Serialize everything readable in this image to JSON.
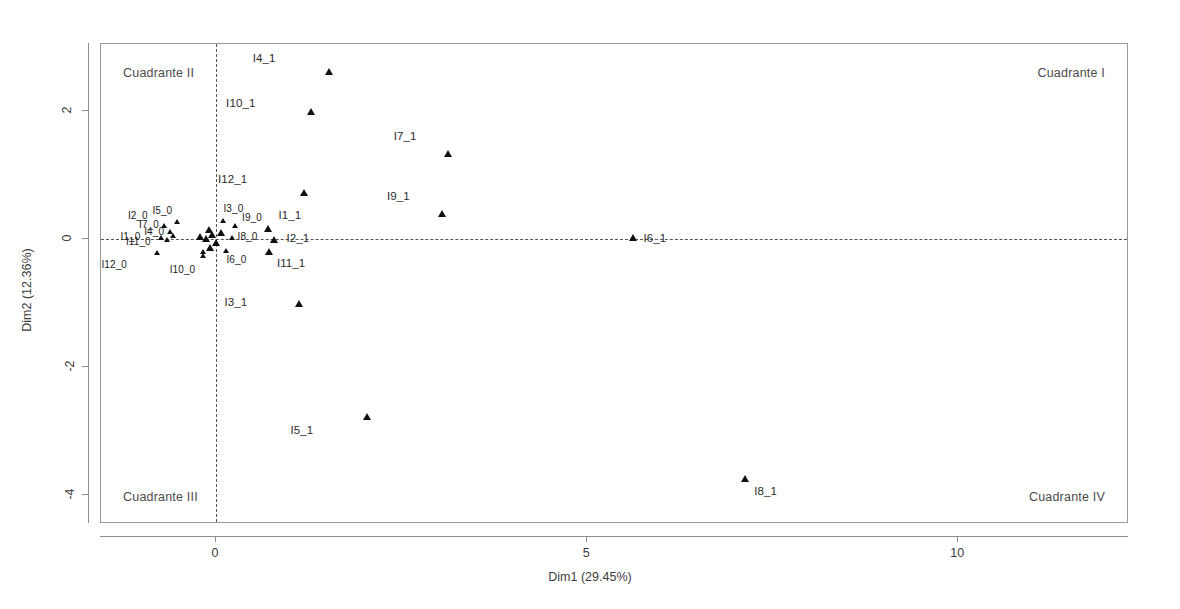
{
  "chart_data": {
    "type": "scatter",
    "title": "",
    "xlabel": "Dim1 (29.45%)",
    "ylabel": "Dim2 (12.36%)",
    "xlim": [
      -1.55,
      12.3
    ],
    "ylim": [
      -4.45,
      3.05
    ],
    "xticks": [
      0,
      5,
      10
    ],
    "xticklabels": [
      "0",
      "5",
      "10"
    ],
    "yticks": [
      2,
      0,
      -2,
      -4
    ],
    "yticklabels": [
      "2",
      "0",
      "-2",
      "-4"
    ],
    "grid": false,
    "legend": null,
    "reference_lines": {
      "vertical_x": 0,
      "horizontal_y": 0,
      "style": "dashed"
    },
    "marker": "triangle",
    "marker_color": "#111111",
    "annotations": [
      {
        "text": "Cuadrante II",
        "position": "top-left"
      },
      {
        "text": "Cuadrante I",
        "position": "top-right"
      },
      {
        "text": "Cuadrante III",
        "position": "bottom-left"
      },
      {
        "text": "Cuadrante IV",
        "position": "bottom-right"
      }
    ],
    "points": [
      {
        "label": "I4_1",
        "x": 1.52,
        "y": 2.62,
        "lx": -0.72,
        "ly": 0.2,
        "size": "normal"
      },
      {
        "label": "I10_1",
        "x": 1.28,
        "y": 1.98,
        "lx": -0.75,
        "ly": 0.14,
        "size": "normal"
      },
      {
        "label": "I7_1",
        "x": 3.12,
        "y": 1.33,
        "lx": -0.42,
        "ly": 0.26,
        "size": "normal"
      },
      {
        "label": "I12_1",
        "x": 1.18,
        "y": 0.72,
        "lx": -0.76,
        "ly": 0.2,
        "size": "normal"
      },
      {
        "label": "I9_1",
        "x": 3.05,
        "y": 0.4,
        "lx": -0.44,
        "ly": 0.26,
        "size": "normal"
      },
      {
        "label": "I1_1",
        "x": 0.7,
        "y": 0.16,
        "lx": 0.14,
        "ly": 0.2,
        "size": "normal"
      },
      {
        "label": "I2_1",
        "x": 0.78,
        "y": -0.02,
        "lx": 0.17,
        "ly": 0.02,
        "size": "normal"
      },
      {
        "label": "I11_1",
        "x": 0.72,
        "y": -0.2,
        "lx": 0.1,
        "ly": -0.18,
        "size": "normal"
      },
      {
        "label": "I6_1",
        "x": 5.62,
        "y": 0.02,
        "lx": 0.14,
        "ly": -0.02,
        "size": "normal"
      },
      {
        "label": "I3_1",
        "x": 1.12,
        "y": -1.02,
        "lx": -0.7,
        "ly": 0.02,
        "size": "normal"
      },
      {
        "label": "I5_1",
        "x": 2.03,
        "y": -2.78,
        "lx": -0.72,
        "ly": -0.22,
        "size": "normal"
      },
      {
        "label": "I8_1",
        "x": 7.12,
        "y": -3.75,
        "lx": 0.13,
        "ly": -0.2,
        "size": "normal"
      },
      {
        "label": "I5_0",
        "x": -0.52,
        "y": 0.27,
        "lx": -0.07,
        "ly": 0.16,
        "size": "small"
      },
      {
        "label": "I2_0",
        "x": -0.7,
        "y": 0.2,
        "lx": -0.22,
        "ly": 0.14,
        "size": "small"
      },
      {
        "label": "I7_0",
        "x": -0.62,
        "y": 0.12,
        "lx": -0.15,
        "ly": 0.09,
        "size": "small"
      },
      {
        "label": "I4_0",
        "x": -0.58,
        "y": 0.05,
        "lx": -0.12,
        "ly": 0.04,
        "size": "small"
      },
      {
        "label": "I1_0",
        "x": -0.74,
        "y": 0.02,
        "lx": -0.28,
        "ly": 0.0,
        "size": "small"
      },
      {
        "label": "I11_0",
        "x": -0.66,
        "y": -0.02,
        "lx": -0.22,
        "ly": -0.04,
        "size": "small"
      },
      {
        "label": "I12_0",
        "x": -0.8,
        "y": -0.22,
        "lx": -0.4,
        "ly": -0.2,
        "size": "small"
      },
      {
        "label": "I10_0",
        "x": -0.18,
        "y": -0.26,
        "lx": -0.1,
        "ly": -0.24,
        "size": "small"
      },
      {
        "label": "I3_0",
        "x": 0.1,
        "y": 0.28,
        "lx": 0.0,
        "ly": 0.18,
        "size": "small"
      },
      {
        "label": "I9_0",
        "x": 0.25,
        "y": 0.2,
        "lx": 0.1,
        "ly": 0.12,
        "size": "small"
      },
      {
        "label": "I8_0",
        "x": 0.22,
        "y": 0.02,
        "lx": 0.07,
        "ly": 0.0,
        "size": "small"
      },
      {
        "label": "I6_0",
        "x": 0.14,
        "y": -0.18,
        "lx": 0.0,
        "ly": -0.16,
        "size": "small"
      },
      {
        "label": "",
        "x": -0.1,
        "y": 0.14,
        "lx": 0,
        "ly": 0,
        "size": "normal"
      },
      {
        "label": "",
        "x": -0.05,
        "y": 0.06,
        "lx": 0,
        "ly": 0,
        "size": "normal"
      },
      {
        "label": "",
        "x": -0.14,
        "y": 0.0,
        "lx": 0,
        "ly": 0,
        "size": "normal"
      },
      {
        "label": "",
        "x": 0.0,
        "y": -0.06,
        "lx": 0,
        "ly": 0,
        "size": "normal"
      },
      {
        "label": "",
        "x": -0.08,
        "y": -0.14,
        "lx": 0,
        "ly": 0,
        "size": "normal"
      },
      {
        "label": "",
        "x": 0.06,
        "y": 0.1,
        "lx": 0,
        "ly": 0,
        "size": "normal"
      },
      {
        "label": "",
        "x": -0.22,
        "y": 0.04,
        "lx": 0,
        "ly": 0,
        "size": "normal"
      },
      {
        "label": "",
        "x": -0.18,
        "y": -0.2,
        "lx": 0,
        "ly": 0,
        "size": "small"
      }
    ]
  },
  "quadrants": {
    "q1": "Cuadrante I",
    "q2": "Cuadrante II",
    "q3": "Cuadrante III",
    "q4": "Cuadrante IV"
  },
  "axes": {
    "x_title": "Dim1 (29.45%)",
    "y_title": "Dim2 (12.36%)"
  }
}
